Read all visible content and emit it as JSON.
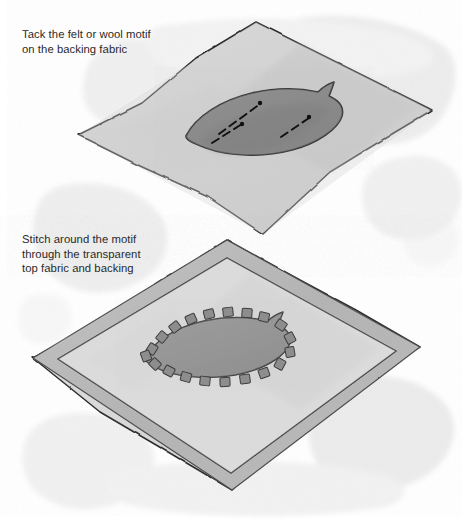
{
  "illustration": {
    "title": "Appliqué with transparent top fabric",
    "width": 462,
    "height": 525,
    "background_color": "#ffffff"
  },
  "captions": {
    "top": "Tack the felt or wool motif\non the backing fabric",
    "bottom": "Stitch around the motif\nthrough the transparent\ntop fabric and backing"
  },
  "palette": {
    "paper": "#ffffff",
    "wash": "#ededed",
    "wash_deep": "#e3e3e3",
    "fabric_fill": "#d2d2d2",
    "fabric_fill_light": "#dedede",
    "top_fabric_fill": "#dcdcdc",
    "border_band": "#b8b8b8",
    "motif_fill": "#8d8d8d",
    "motif_fill_light": "#9a9a9a",
    "motif_stroke": "#3a3a3a",
    "outline": "#2b2b2b",
    "stitch_fill": "#8a8a8a",
    "stitch_stroke": "#3c3c3c",
    "tack_stitch": "#111111",
    "text": "#2a2a2a"
  },
  "panels": [
    {
      "name": "panel-top",
      "step": 1,
      "label": "Backing fabric with tacked motif",
      "caption_ref": "captions.top",
      "fabric": {
        "name": "backing-fabric",
        "shape": "diamond",
        "corners": {
          "top": [
            256,
            22
          ],
          "right": [
            432,
            110
          ],
          "bottom": [
            263,
            234
          ],
          "left": [
            78,
            135
          ]
        }
      },
      "motif": {
        "name": "felt-motif",
        "shape": "leaf",
        "center": [
          263,
          122
        ],
        "tack_stitches": 3
      }
    },
    {
      "name": "panel-bottom",
      "step": 2,
      "label": "Transparent top fabric over backing, motif stitched",
      "caption_ref": "captions.bottom",
      "fabric": {
        "name": "transparent-top-fabric",
        "shape": "diamond-with-border",
        "corners": {
          "top": [
            227,
            240
          ],
          "right": [
            420,
            347
          ],
          "bottom": [
            232,
            490
          ],
          "left": [
            33,
            358
          ]
        },
        "border_inset": 14
      },
      "motif": {
        "name": "stitched-motif",
        "shape": "leaf",
        "center": [
          228,
          348
        ],
        "blanket_stitches": 20
      }
    }
  ]
}
